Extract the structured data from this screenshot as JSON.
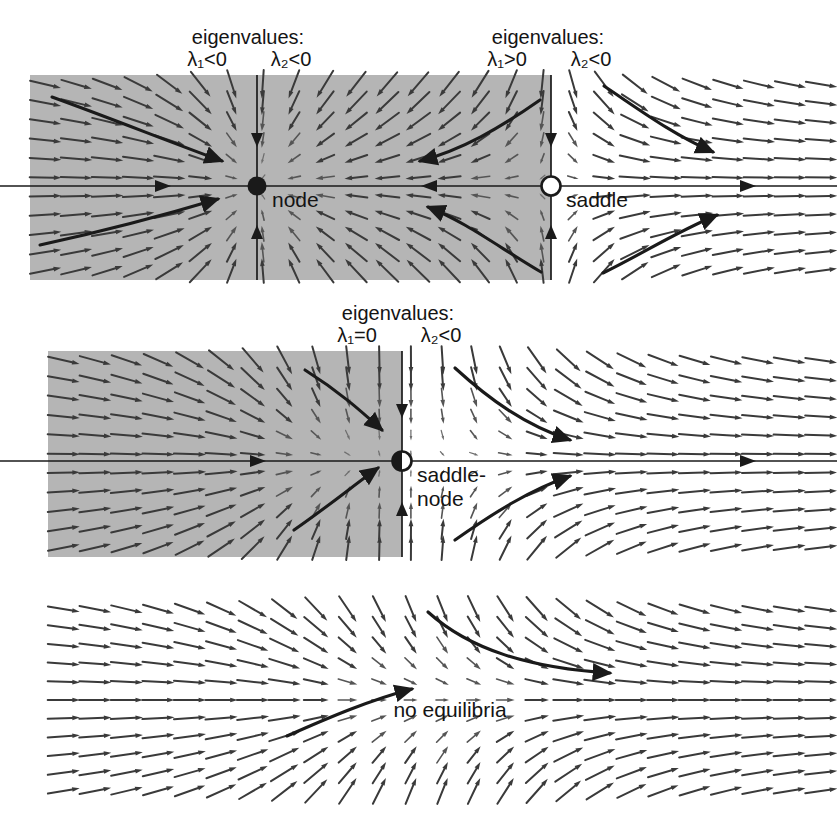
{
  "figure": {
    "background_color": "#ffffff",
    "shade_color": "#b5b5b5",
    "ink_color": "#1a1a1a"
  },
  "panels": [
    {
      "id": "panel-top",
      "name": "node-and-saddle",
      "shaded_region": {
        "x": 30,
        "y": 75,
        "width": 521,
        "height": 205
      },
      "field_region": {
        "x": 30,
        "y": 75,
        "width": 807,
        "height": 205
      },
      "axis_y": 186,
      "eigenvalue_labels": [
        {
          "id": "eig-node",
          "line1": "eigenvalues:",
          "lambda1": "λ₁<0",
          "lambda2": "λ₂<0",
          "x": 248,
          "y": 44
        },
        {
          "id": "eig-saddle",
          "line1": "eigenvalues:",
          "lambda1": "λ₁>0",
          "lambda2": "λ₂<0",
          "x": 548,
          "y": 44
        }
      ],
      "equilibria": [
        {
          "id": "eq-node",
          "label": "node",
          "kind": "stable-node",
          "marker": "filled-circle",
          "x": 257,
          "y": 186,
          "label_x": 272,
          "label_y": 206
        },
        {
          "id": "eq-saddle",
          "label": "saddle",
          "kind": "saddle",
          "marker": "open-circle",
          "x": 551,
          "y": 186,
          "label_x": 566,
          "label_y": 206
        }
      ]
    },
    {
      "id": "panel-middle",
      "name": "saddle-node",
      "shaded_region": {
        "x": 48,
        "y": 351,
        "width": 354,
        "height": 206
      },
      "field_region": {
        "x": 48,
        "y": 351,
        "width": 789,
        "height": 206
      },
      "axis_y": 461,
      "eigenvalue_labels": [
        {
          "id": "eig-saddlenode",
          "line1": "eigenvalues:",
          "lambda1": "λ₁=0",
          "lambda2": "λ₂<0",
          "x": 398,
          "y": 320
        }
      ],
      "equilibria": [
        {
          "id": "eq-saddle-node",
          "label": "saddle-",
          "label2": "node",
          "kind": "saddle-node",
          "marker": "half-filled-circle",
          "x": 402,
          "y": 461,
          "label_x": 417,
          "label_y": 481
        }
      ]
    },
    {
      "id": "panel-bottom",
      "name": "no-equilibria",
      "shaded_region": null,
      "field_region": {
        "x": 48,
        "y": 600,
        "width": 789,
        "height": 200
      },
      "axis_y": null,
      "eigenvalue_labels": [],
      "equilibria": [],
      "annotation": {
        "id": "ann-no-equilibria",
        "label": "no equilibria",
        "x": 450,
        "y": 716
      }
    }
  ],
  "chart_data": {
    "type": "vector-field",
    "panel_count": 3,
    "panels": [
      {
        "name": "node-and-saddle",
        "description": "Two equilibria: a stable node at left and a saddle at right; gray shaded basin between them.",
        "equilibria": [
          {
            "type": "node",
            "marker": "filled",
            "eigenvalues": [
              "λ₁<0",
              "λ₂<0"
            ]
          },
          {
            "type": "saddle",
            "marker": "open",
            "eigenvalues": [
              "λ₁>0",
              "λ₂<0"
            ]
          }
        ],
        "trajectories": 6
      },
      {
        "name": "saddle-node",
        "description": "Single degenerate equilibrium (saddle-node) with one zero eigenvalue; half-filled marker.",
        "equilibria": [
          {
            "type": "saddle-node",
            "marker": "half-filled",
            "eigenvalues": [
              "λ₁=0",
              "λ₂<0"
            ]
          }
        ],
        "trajectories": 4
      },
      {
        "name": "no-equilibria",
        "description": "No fixed points; all orbits flow to the right.",
        "equilibria": [],
        "trajectories": 2
      }
    ]
  }
}
